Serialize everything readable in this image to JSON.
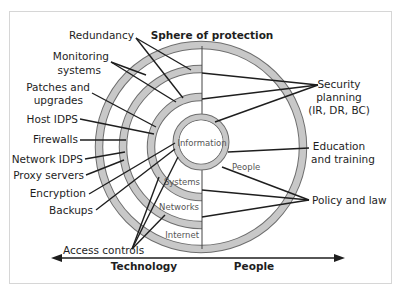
{
  "title": "Sphere of protection",
  "center": {
    "label": "Information"
  },
  "regions": {
    "people": "People",
    "systems": "Systems",
    "networks": "Networks",
    "internet": "Internet"
  },
  "left_labels": {
    "redundancy": "Redundancy",
    "monitoring_1": "Monitoring",
    "monitoring_2": "systems",
    "patches_1": "Patches and",
    "patches_2": "upgrades",
    "host_idps": "Host IDPS",
    "firewalls": "Firewalls",
    "network_idps": "Network IDPS",
    "proxy_servers": "Proxy servers",
    "encryption": "Encryption",
    "backups": "Backups",
    "access_controls": "Access controls"
  },
  "right_labels": {
    "security_1": "Security",
    "security_2": "planning",
    "security_3": "(IR, DR, BC)",
    "education_1": "Education",
    "education_2": "and training",
    "policy": "Policy and law"
  },
  "axis": {
    "left": "Technology",
    "right": "People"
  },
  "colors": {
    "ring_fill": "#c8c8c8",
    "ring_stroke": "#6e6e6e",
    "line": "#1e1e1e",
    "frame": "#d6d6d6"
  }
}
